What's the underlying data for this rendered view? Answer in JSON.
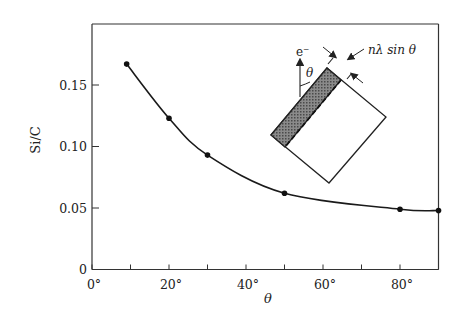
{
  "chart_data": {
    "type": "line",
    "title": "",
    "xlabel": "θ",
    "ylabel": "Si/C",
    "xlim": [
      0,
      90
    ],
    "ylim": [
      0,
      0.19
    ],
    "grid": false,
    "legend": null,
    "x_ticks": [
      0,
      10,
      20,
      30,
      40,
      50,
      60,
      70,
      80,
      90
    ],
    "x_tick_labels": [
      "0°",
      "20°",
      "40°",
      "60°",
      "80°"
    ],
    "y_ticks": [
      0,
      0.05,
      0.1,
      0.15
    ],
    "y_tick_labels": [
      "0",
      "0.05",
      "0.10",
      "0.15"
    ],
    "series": [
      {
        "name": "Si/C",
        "x": [
          9,
          20,
          30,
          50,
          80,
          90
        ],
        "y": [
          0.167,
          0.123,
          0.093,
          0.062,
          0.049,
          0.048
        ],
        "marker": "filled-circle",
        "line": "smooth"
      }
    ],
    "inset": {
      "description": "Tilted sample block with shaded surface layer; electron beam e⁻ arrow at angle θ; analysis depth nλ sin θ",
      "beam_label": "e⁻",
      "angle_label": "θ",
      "depth_label": "nλ sin θ"
    }
  },
  "colors": {
    "line": "#1a1a1a",
    "axis": "#333333",
    "shade": "#6b6b6b",
    "background": "#ffffff"
  }
}
